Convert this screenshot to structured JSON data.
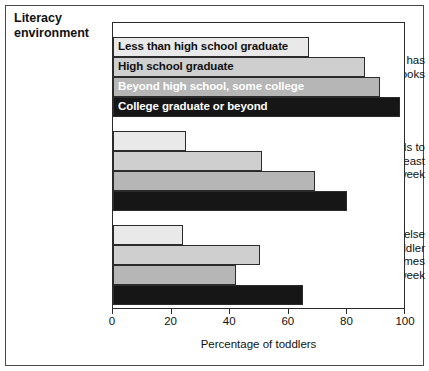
{
  "chart_data": {
    "type": "bar",
    "orientation": "horizontal",
    "title": "Literacy environment",
    "xlabel": "Percentage of toddlers",
    "ylabel": "",
    "xlim": [
      0,
      100
    ],
    "xticks": [
      0,
      20,
      40,
      60,
      80,
      100
    ],
    "grid": false,
    "legend_position": "inside-bars",
    "series": [
      {
        "name": "Less than high school graduate",
        "values": [
          67,
          25,
          24
        ],
        "fill": "#e9e9e9",
        "text_color": "#111111"
      },
      {
        "name": "High school graduate",
        "values": [
          86,
          51,
          50
        ],
        "fill": "#cfcfcf",
        "text_color": "#111111"
      },
      {
        "name": "Beyond high school, some college",
        "values": [
          91,
          69,
          42
        ],
        "fill": "#b6b6b6",
        "text_color": "#ffffff"
      },
      {
        "name": "College graduate or beyond",
        "values": [
          98,
          80,
          65
        ],
        "fill": "#161616",
        "text_color": "#ffffff"
      }
    ],
    "categories": [
      "Toddler has\n3 or more books",
      "Mother reads to\ntoddler at least\n3 times per week",
      "Someone else\nreads to toddler\nat least 3 times\nper week"
    ]
  },
  "chart": {
    "title_line1": "Literacy",
    "title_line2": "environment",
    "xlabel": "Percentage of toddlers",
    "ticklabels": [
      "0",
      "20",
      "40",
      "60",
      "80",
      "100"
    ],
    "categories": [
      {
        "lines": [
          "Toddler has",
          "3 or more books"
        ]
      },
      {
        "lines": [
          "Mother reads to",
          "toddler at least",
          "3 times per week"
        ]
      },
      {
        "lines": [
          "Someone else",
          "reads to toddler",
          "at least 3 times",
          "per week"
        ]
      }
    ],
    "series_labels": [
      "Less than high school graduate",
      "High school graduate",
      "Beyond high school, some college",
      "College graduate or beyond"
    ]
  }
}
